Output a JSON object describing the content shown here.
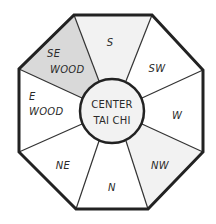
{
  "diagram": {
    "type": "bagua-octagon",
    "colors": {
      "outline": "#222222",
      "divider": "#333333",
      "white": "#ffffff",
      "light_gray": "#f2f2f2",
      "gray": "#d9d9d9"
    },
    "sectors": [
      {
        "id": "s",
        "label_lines": [
          "S"
        ],
        "fill": "#f2f2f2"
      },
      {
        "id": "sw",
        "label_lines": [
          "SW"
        ],
        "fill": "#ffffff"
      },
      {
        "id": "w",
        "label_lines": [
          "W"
        ],
        "fill": "#ffffff"
      },
      {
        "id": "nw",
        "label_lines": [
          "NW"
        ],
        "fill": "#f2f2f2"
      },
      {
        "id": "n",
        "label_lines": [
          "N"
        ],
        "fill": "#ffffff"
      },
      {
        "id": "ne",
        "label_lines": [
          "NE"
        ],
        "fill": "#ffffff"
      },
      {
        "id": "e",
        "label_lines": [
          "E",
          "WOOD"
        ],
        "fill": "#ffffff"
      },
      {
        "id": "se",
        "label_lines": [
          "SE",
          "WOOD"
        ],
        "fill": "#d9d9d9"
      }
    ],
    "center": {
      "label_lines": [
        "CENTER",
        "TAI CHI"
      ],
      "fill": "#f2f2f2"
    }
  }
}
